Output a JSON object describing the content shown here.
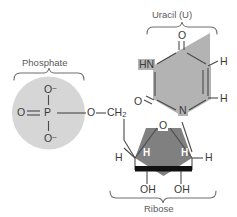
{
  "figure": {
    "colors": {
      "background": "#ffffff",
      "phosphate_fill": "#d6d6d6",
      "uracil_fill": "#b3b3b3",
      "ribose_fill": "#808080",
      "bond_line": "#4a4a4a",
      "bold_bond": "#111111",
      "label_text": "#5a5a5a",
      "atom_text": "#3a3a3a",
      "inner_h_text": "#ffffff"
    }
  },
  "groups": {
    "phosphate": {
      "label": "Phosphate",
      "brace": "up"
    },
    "uracil": {
      "label": "Uracil (U)",
      "brace": "up"
    },
    "ribose": {
      "label": "Ribose",
      "brace": "down"
    }
  },
  "atoms": {
    "phosphate": {
      "center": "P",
      "o_top": "O",
      "o_top_charge": "–",
      "o_bottom": "O",
      "o_bottom_charge": "–",
      "o_left": "O",
      "o_ester": "O"
    },
    "linker": {
      "ch2": "CH",
      "ch2_sub": "2"
    },
    "ribose": {
      "ring_oxygen": "O",
      "h_inner_left": "H",
      "h_inner_right": "H",
      "h_outer_left": "H",
      "h_outer_right": "H",
      "oh_left": "OH",
      "oh_right": "OH"
    },
    "uracil": {
      "o_top": "O",
      "o_left": "O",
      "hn": "HN",
      "n_bottom": "N",
      "h_right_top": "H",
      "h_right_bottom": "H"
    }
  }
}
